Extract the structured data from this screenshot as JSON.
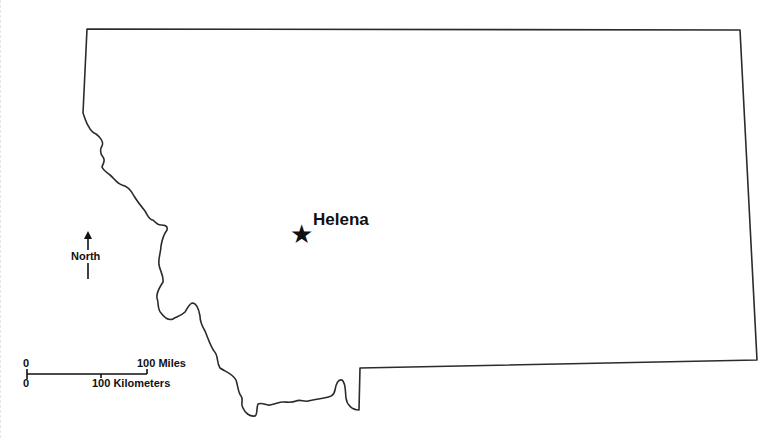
{
  "map": {
    "subject": "Montana state outline",
    "background_color": "#ffffff",
    "outline_color": "#2b2b2b",
    "capital": {
      "name": "Helena",
      "marker": "star-icon",
      "marker_glyph": "★",
      "position": {
        "x": 302,
        "y": 234
      }
    },
    "compass": {
      "label": "North",
      "icon": "north-arrow-icon"
    },
    "scale_bar": {
      "miles": {
        "start_label": "0",
        "end_label": "100 Miles"
      },
      "kilometers": {
        "start_label": "0",
        "end_label": "100 Kilometers"
      }
    }
  }
}
